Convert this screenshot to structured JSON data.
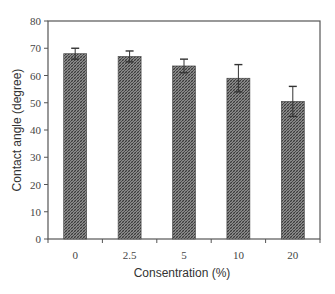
{
  "chart_data": {
    "type": "bar",
    "title": "",
    "xlabel": "Consentration (%)",
    "ylabel": "Contact angle (degree)",
    "categories": [
      "0",
      "2.5",
      "5",
      "10",
      "20"
    ],
    "values": [
      68,
      67,
      63.5,
      59,
      50.5
    ],
    "error": [
      2,
      2,
      2.5,
      5,
      5.5
    ],
    "ylim": [
      0,
      80
    ],
    "yticks": [
      0,
      10,
      20,
      30,
      40,
      50,
      60,
      70,
      80
    ],
    "grid": false,
    "legend": null,
    "bar_fill": "hatched",
    "bar_color": "#6a6a6a",
    "axis_color": "#555555"
  }
}
